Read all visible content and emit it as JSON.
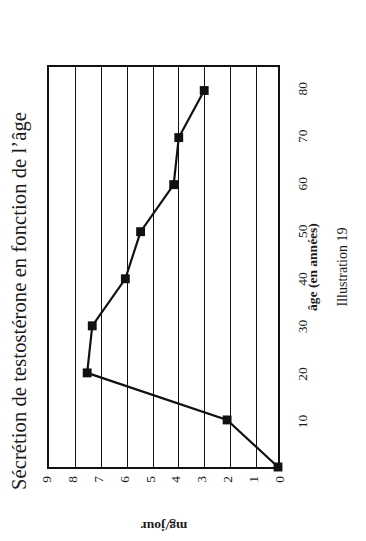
{
  "figure": {
    "title": "Sécrétion de testostérone en fonction de l’âge",
    "caption": "Illustration 19"
  },
  "chart_data": {
    "type": "line",
    "title": "Sécrétion de testostérone en fonction de l’âge",
    "xlabel": "âge (en années)",
    "ylabel": "mg/jour",
    "x": [
      0,
      10,
      20,
      30,
      40,
      50,
      60,
      70,
      80
    ],
    "values": [
      0,
      2,
      7.5,
      7.3,
      6,
      5.4,
      4.1,
      3.9,
      2.9
    ],
    "series": [
      {
        "name": "Sécrétion de testostérone",
        "values": [
          0,
          2,
          7.5,
          7.3,
          6,
          5.4,
          4.1,
          3.9,
          2.9
        ]
      }
    ],
    "xlim": [
      0,
      85
    ],
    "ylim": [
      0,
      9
    ],
    "xticks": [
      10,
      20,
      30,
      40,
      50,
      60,
      70,
      80
    ],
    "xtick_labels": [
      "10",
      "20",
      "30",
      "40",
      "50",
      "60",
      "70",
      "80"
    ],
    "yticks": [
      0,
      1,
      2,
      3,
      4,
      5,
      6,
      7,
      8,
      9
    ],
    "ytick_labels": [
      "0",
      "1",
      "2",
      "3",
      "4",
      "5",
      "6",
      "7",
      "8",
      "9"
    ],
    "grid": "horizontal",
    "legend": "none",
    "marker": "square",
    "marker_color": "#111111",
    "line_color": "#111111",
    "frame_color": "#111111",
    "background": "#ffffff",
    "rotation_degrees": -90
  }
}
